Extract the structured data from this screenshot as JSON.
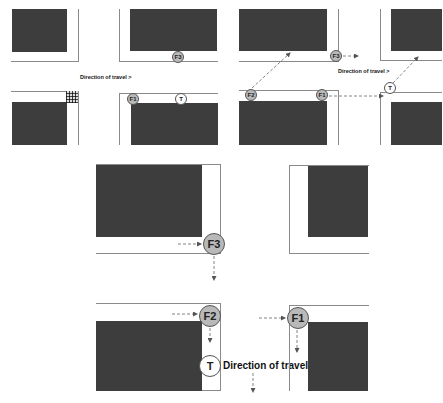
{
  "diagram": {
    "type": "traffic-intersection-sequence",
    "panels": [
      {
        "id": "top-left",
        "markers": [
          {
            "label": "F3",
            "style": "filled"
          },
          {
            "label": "F1",
            "style": "filled"
          },
          {
            "label": "T",
            "style": "open"
          }
        ],
        "direction_label": "Direction of travel >"
      },
      {
        "id": "top-right",
        "markers": [
          {
            "label": "F3",
            "style": "filled"
          },
          {
            "label": "F2",
            "style": "filled"
          },
          {
            "label": "F1",
            "style": "filled"
          },
          {
            "label": "T",
            "style": "open"
          }
        ],
        "direction_label": "Direction of travel >"
      },
      {
        "id": "bottom",
        "markers": [
          {
            "label": "F3",
            "style": "filled"
          },
          {
            "label": "F2",
            "style": "filled"
          },
          {
            "label": "F1",
            "style": "filled"
          },
          {
            "label": "T",
            "style": "open"
          }
        ],
        "direction_label": "Direction of travel"
      }
    ]
  },
  "labels": {
    "f1": "F1",
    "f2": "F2",
    "f3": "F3",
    "t": "T",
    "direction_right": "Direction of travel >",
    "direction_down": "Direction of travel"
  },
  "colors": {
    "block": "#3d3d3d",
    "road_edge": "#8a8a8a",
    "marker_fill": "#b9b9b9",
    "marker_open": "#ffffff",
    "arrow": "#666666"
  }
}
